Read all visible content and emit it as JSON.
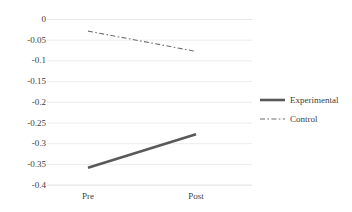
{
  "chart_data": {
    "type": "line",
    "title": "",
    "xlabel": "",
    "ylabel": "",
    "categories": [
      "Pre",
      "Post"
    ],
    "x": [
      0,
      1
    ],
    "ylim": [
      -0.4,
      0
    ],
    "yticks": [
      0,
      -0.05,
      -0.1,
      -0.15,
      -0.2,
      -0.25,
      -0.3,
      -0.35,
      -0.4
    ],
    "ytick_labels": [
      "0",
      "-0.05",
      "-0.1",
      "-0.15",
      "-0.2",
      "-0.25",
      "-0.3",
      "-0.35",
      "-0.4"
    ],
    "grid": true,
    "grid_axis": "y",
    "legend_position": "right",
    "series": [
      {
        "name": "Experimental",
        "values": [
          -0.358,
          -0.277
        ],
        "style": "solid",
        "color": "#595959",
        "width": 2.6
      },
      {
        "name": "Control",
        "values": [
          -0.028,
          -0.077
        ],
        "style": "dashdot",
        "color": "#6e6e6e",
        "width": 1.1
      }
    ]
  },
  "axes": {
    "y_tick_labels": [
      "0",
      "-0.05",
      "-0.1",
      "-0.15",
      "-0.2",
      "-0.25",
      "-0.3",
      "-0.35",
      "-0.4"
    ],
    "x_tick_labels": [
      "Pre",
      "Post"
    ]
  },
  "legend": {
    "entries": [
      {
        "label": "Experimental",
        "style": "solid"
      },
      {
        "label": "Control",
        "style": "dashdot"
      }
    ]
  },
  "colors": {
    "gridline": "#e8e8e8",
    "axis_line": "#d9d9d9",
    "experimental": "#595959",
    "control": "#6e6e6e",
    "text": "#404040",
    "background": "#ffffff"
  }
}
